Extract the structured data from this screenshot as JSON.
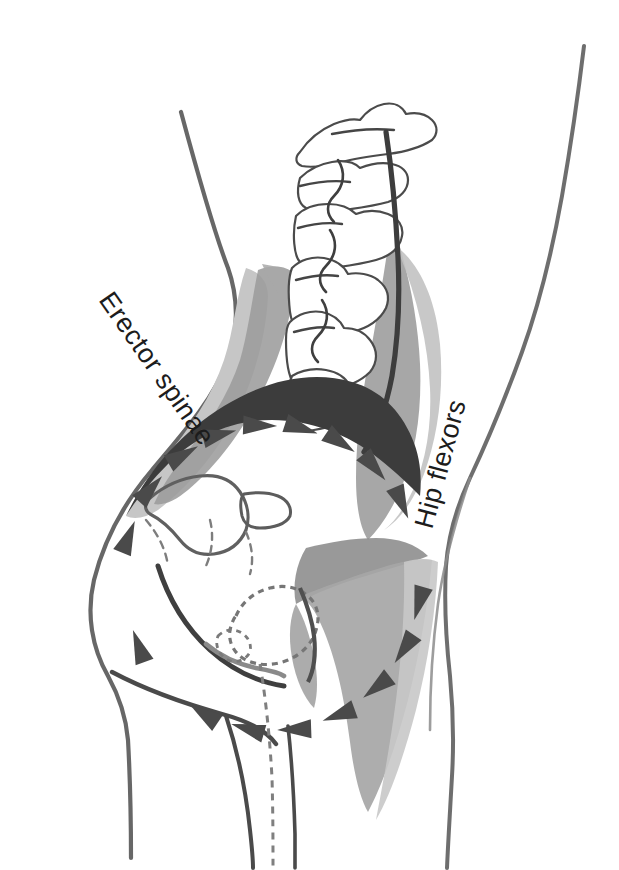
{
  "figure": {
    "kind": "anatomical-illustration",
    "view": "lateral / sagittal view of lumbar spine, pelvis and hip",
    "background_color": "#ffffff",
    "palette": {
      "outline_dark": "#3a3a3a",
      "outline_mid": "#6e6e6e",
      "bone_line": "#555555",
      "muscle_light_gray": "#c6c6c6",
      "muscle_mid_gray": "#9c9c9c",
      "muscle_dark_gray": "#8a8a8a",
      "iliac_crest_line": "#3c3c3c",
      "arrow_fill": "#4a4a4a",
      "label_color": "#1c1c1c"
    }
  },
  "labels": {
    "erector_spinae": {
      "text": "Erector spinae",
      "rotation_deg": 55,
      "x": 98,
      "y": 300,
      "font_size": 27
    },
    "hip_flexors": {
      "text": "Hip flexors",
      "rotation_deg": -75,
      "x": 432,
      "y": 530,
      "font_size": 27
    }
  },
  "rotation_indicator": {
    "name": "pelvic-rotation-arrow-ring",
    "direction": "clockwise",
    "center_x": 272,
    "center_y": 578,
    "radius_x": 148,
    "radius_y": 152,
    "arrow_count": 17,
    "arrow_length": 34,
    "arrow_width": 19,
    "arrow_angles_deg": [
      202,
      222,
      240,
      256,
      272,
      288,
      304,
      320,
      337,
      16,
      34,
      52,
      70,
      88,
      106,
      124,
      160
    ]
  },
  "anatomy_parts": [
    {
      "name": "body-outline-posterior",
      "description": "back / buttock skin contour on left side"
    },
    {
      "name": "body-outline-anterior",
      "description": "abdomen / front thigh skin contour on right side"
    },
    {
      "name": "lumbar-vertebrae",
      "description": "five lumbar vertebral bodies with spinous processes"
    },
    {
      "name": "sacrum",
      "description": "sacral segment below L5"
    },
    {
      "name": "pelvis-ilium",
      "description": "ilium with iliac crest, ASIS and acetabulum"
    },
    {
      "name": "femur-head-neck",
      "description": "proximal femur with head, neck and greater trochanter"
    },
    {
      "name": "erector-spinae-muscle",
      "description": "posterior paraspinal muscle band, shaded gray"
    },
    {
      "name": "hip-flexor-muscle",
      "description": "iliopsoas / rectus femoris group, shaded gray"
    },
    {
      "name": "iliac-crest-highlight",
      "description": "thick dark arc marking the superior pelvic rim"
    }
  ]
}
